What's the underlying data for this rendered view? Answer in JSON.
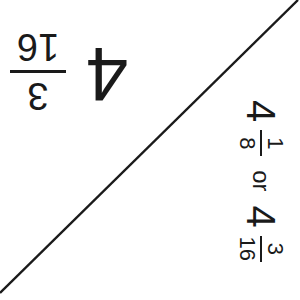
{
  "colors": {
    "ink": "#1a1a1a",
    "background": "#ffffff"
  },
  "diagonal_line": {
    "x1": 0,
    "y1": 293,
    "x2": 298,
    "y2": 0
  },
  "top_left_mixed_number": {
    "orientation": "rotated-180",
    "whole": "4",
    "numerator": "3",
    "denominator": "16"
  },
  "right_side_text": {
    "orientation": "rotated-90-clockwise",
    "first": {
      "whole": "4",
      "numerator": "1",
      "denominator": "8"
    },
    "connector": "or",
    "second": {
      "whole": "4",
      "numerator": "3",
      "denominator": "16"
    }
  }
}
